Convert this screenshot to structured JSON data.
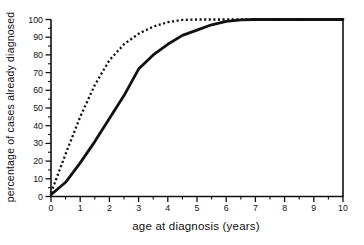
{
  "chart_data": {
    "type": "line",
    "title": "",
    "xlabel": "age at diagnosis (years)",
    "ylabel": "percentage of cases already diagnosed",
    "xlim": [
      0,
      10
    ],
    "ylim": [
      0,
      100
    ],
    "x_ticks": [
      0,
      1,
      2,
      3,
      4,
      5,
      6,
      7,
      8,
      9,
      10
    ],
    "x_minor_step": 0.5,
    "y_ticks": [
      0,
      10,
      20,
      30,
      40,
      50,
      60,
      70,
      80,
      90,
      100
    ],
    "y_minor_step": 5,
    "grid": false,
    "legend": "none",
    "axis_color": "#111111",
    "series": [
      {
        "name": "solid-curve",
        "style": "solid",
        "color": "#111111",
        "x": [
          0,
          0.5,
          1,
          1.5,
          2,
          2.5,
          3,
          3.5,
          4,
          4.5,
          5,
          5.5,
          6,
          6.5,
          7,
          7.5,
          8,
          8.5,
          9,
          9.5,
          10
        ],
        "y": [
          1,
          8,
          19,
          31,
          44,
          57,
          72,
          80,
          86,
          91,
          94,
          97,
          99,
          99.8,
          100,
          100,
          100,
          100,
          100,
          100,
          100
        ]
      },
      {
        "name": "dotted-curve",
        "style": "dotted",
        "color": "#111111",
        "x": [
          0,
          0.5,
          1,
          1.5,
          2,
          2.5,
          3,
          3.5,
          4,
          4.5,
          5,
          5.5,
          6,
          6.5,
          7,
          7.5,
          8,
          8.5,
          9,
          9.5,
          10
        ],
        "y": [
          2,
          24,
          45,
          63,
          77,
          86,
          92,
          96,
          98.5,
          99.8,
          100,
          100,
          100,
          100,
          100,
          100,
          100,
          100,
          100,
          100,
          100
        ]
      }
    ]
  }
}
